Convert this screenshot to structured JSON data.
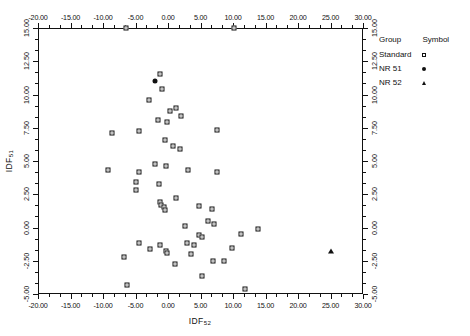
{
  "chart_data": {
    "type": "scatter",
    "title": "",
    "xlabel": "IDF52",
    "ylabel": "IDF51",
    "xlabel_base": "IDF",
    "xlabel_sub": "52",
    "ylabel_base": "IDF",
    "ylabel_sub": "51",
    "xlim": [
      -20.0,
      30.0
    ],
    "ylim": [
      -5.0,
      15.0
    ],
    "grid": false,
    "x_major_step": 5.0,
    "y_major_step": 2.5,
    "x_minor_per_major": 2,
    "y_minor_per_major": 2,
    "axes_mirrored": true,
    "xticklabels": [
      "-20.00",
      "-15.00",
      "-10.00",
      "-5.00",
      "0.00",
      "5.00",
      "10.00",
      "15.00",
      "20.00",
      "25.00",
      "30.00"
    ],
    "xtickvalues": [
      -20,
      -15,
      -10,
      -5,
      0,
      5,
      10,
      15,
      20,
      25,
      30
    ],
    "yticklabels": [
      "15.00",
      "12.50",
      "10.00",
      "7.50",
      "5.00",
      "2.50",
      "0.00",
      "-2.50",
      "-5.00"
    ],
    "ytickvalues": [
      15,
      12.5,
      10,
      7.5,
      5,
      2.5,
      0,
      -2.5,
      -5
    ],
    "legend": {
      "position": "outside-right-top",
      "headers": [
        "Group",
        "Symbol"
      ],
      "entries": [
        {
          "label": "Standard",
          "symbol": "open-square"
        },
        {
          "label": "NR 51",
          "symbol": "filled-circle"
        },
        {
          "label": "NR 52",
          "symbol": "filled-triangle"
        }
      ]
    },
    "series": [
      {
        "name": "Standard",
        "symbol": "open-square",
        "points": [
          [
            -1.2,
            11.55
          ],
          [
            -1.0,
            10.45
          ],
          [
            -3.0,
            9.55
          ],
          [
            -1.5,
            8.05
          ],
          [
            0.3,
            8.75
          ],
          [
            -0.2,
            7.95
          ],
          [
            2.0,
            8.35
          ],
          [
            1.3,
            9.0
          ],
          [
            -4.4,
            7.25
          ],
          [
            -8.6,
            7.1
          ],
          [
            7.6,
            7.3
          ],
          [
            -0.4,
            6.55
          ],
          [
            1.8,
            5.9
          ],
          [
            0.8,
            6.1
          ],
          [
            -9.2,
            4.3
          ],
          [
            -4.4,
            4.2
          ],
          [
            -2.0,
            4.75
          ],
          [
            -0.3,
            4.6
          ],
          [
            3.1,
            4.35
          ],
          [
            7.5,
            4.2
          ],
          [
            -5.0,
            3.4
          ],
          [
            -5.0,
            2.85
          ],
          [
            -1.4,
            3.3
          ],
          [
            -1.2,
            1.95
          ],
          [
            -1.1,
            1.7
          ],
          [
            1.3,
            2.2
          ],
          [
            -0.6,
            1.55
          ],
          [
            -0.5,
            1.3
          ],
          [
            4.7,
            1.6
          ],
          [
            6.8,
            1.4
          ],
          [
            6.1,
            0.5
          ],
          [
            7.0,
            0.3
          ],
          [
            2.6,
            0.1
          ],
          [
            4.7,
            -0.6
          ],
          [
            5.2,
            -0.75
          ],
          [
            -4.5,
            -1.2
          ],
          [
            -1.2,
            -1.3
          ],
          [
            2.9,
            -1.2
          ],
          [
            4.0,
            -1.3
          ],
          [
            -2.7,
            -1.65
          ],
          [
            -0.3,
            -1.75
          ],
          [
            -0.1,
            -1.9
          ],
          [
            9.9,
            -1.55
          ],
          [
            13.9,
            -0.15
          ],
          [
            11.3,
            -0.5
          ],
          [
            3.6,
            -2.0
          ],
          [
            -6.8,
            -2.25
          ],
          [
            1.0,
            -2.75
          ],
          [
            6.9,
            -2.55
          ],
          [
            8.6,
            -2.55
          ],
          [
            -6.3,
            -4.3
          ],
          [
            5.3,
            -3.65
          ],
          [
            -6.4,
            15.0
          ],
          [
            10.2,
            15.0
          ],
          [
            11.8,
            -4.65
          ]
        ]
      },
      {
        "name": "NR 51",
        "symbol": "filled-circle",
        "points": [
          [
            -2.0,
            11.0
          ]
        ]
      },
      {
        "name": "NR 52",
        "symbol": "filled-triangle",
        "points": [
          [
            25.0,
            -1.75
          ]
        ]
      }
    ]
  }
}
